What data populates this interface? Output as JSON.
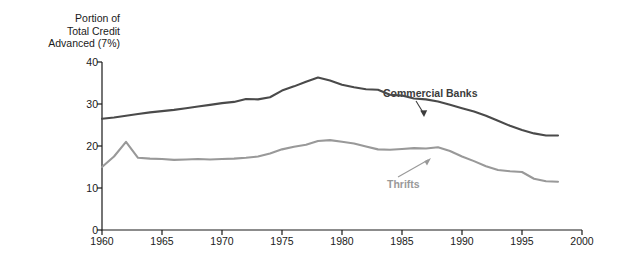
{
  "chart_data": {
    "type": "line",
    "title": "",
    "ylabel": "Portion of\nTotal Credit\nAdvanced (7%)",
    "xlabel": "",
    "xlim": [
      1960,
      2000
    ],
    "ylim": [
      0,
      40
    ],
    "xticks": [
      1960,
      1965,
      1970,
      1975,
      1980,
      1985,
      1990,
      1995,
      2000
    ],
    "yticks": [
      0,
      10,
      20,
      30,
      40
    ],
    "grid": false,
    "legend_position": "inline-annotations",
    "annotations": [
      {
        "text": "Commercial Banks",
        "series": "Commercial Banks",
        "arrow": "down-right"
      },
      {
        "text": "Thrifts",
        "series": "Thrifts",
        "arrow": "up-right"
      }
    ],
    "series": [
      {
        "name": "Commercial Banks",
        "color": "#4a4a4a",
        "x": [
          1960,
          1961,
          1962,
          1963,
          1964,
          1965,
          1966,
          1967,
          1968,
          1969,
          1970,
          1971,
          1972,
          1973,
          1974,
          1975,
          1976,
          1977,
          1978,
          1979,
          1980,
          1981,
          1982,
          1983,
          1984,
          1985,
          1986,
          1987,
          1988,
          1989,
          1990,
          1991,
          1992,
          1993,
          1994,
          1995,
          1996,
          1997,
          1998
        ],
        "values": [
          26.5,
          26.8,
          27.2,
          27.6,
          28.0,
          28.3,
          28.6,
          29.0,
          29.4,
          29.8,
          30.2,
          30.5,
          31.2,
          31.1,
          31.6,
          33.2,
          34.2,
          35.3,
          36.3,
          35.6,
          34.6,
          34.0,
          33.5,
          33.4,
          32.2,
          32.0,
          31.3,
          31.1,
          30.6,
          29.8,
          29.0,
          28.2,
          27.2,
          26.0,
          24.8,
          23.8,
          23.0,
          22.5,
          22.5
        ]
      },
      {
        "name": "Thrifts",
        "color": "#999999",
        "x": [
          1960,
          1961,
          1962,
          1963,
          1964,
          1965,
          1966,
          1967,
          1968,
          1969,
          1970,
          1971,
          1972,
          1973,
          1974,
          1975,
          1976,
          1977,
          1978,
          1979,
          1980,
          1981,
          1982,
          1983,
          1984,
          1985,
          1986,
          1987,
          1988,
          1989,
          1990,
          1991,
          1992,
          1993,
          1994,
          1995,
          1996,
          1997,
          1998
        ],
        "values": [
          15.0,
          17.5,
          21.0,
          17.2,
          17.0,
          16.9,
          16.7,
          16.8,
          16.9,
          16.8,
          16.9,
          17.0,
          17.2,
          17.5,
          18.2,
          19.2,
          19.8,
          20.3,
          21.2,
          21.4,
          21.0,
          20.6,
          19.9,
          19.2,
          19.1,
          19.3,
          19.5,
          19.4,
          19.7,
          18.8,
          17.5,
          16.4,
          15.2,
          14.3,
          14.0,
          13.8,
          12.2,
          11.6,
          11.5
        ]
      }
    ],
    "series_notes": {
      "Commercial Banks": "rises from 26.5 in 1960 to a 1974 peak near 36.4, declines to about 22.5 by 1993-1995, then rises sharply to about 27.5 by 1997-1998",
      "Thrifts": "starts near 15 in 1960, spikes to about 21 in 1962, holds near 17 through the 1960s, peaks near 21.5 in 1978-1979, then declines steadily to about 6.4 by 1998"
    }
  },
  "labels": {
    "y_axis_title": "Portion of\nTotal Credit\nAdvanced (7%)",
    "commercial_banks": "Commercial Banks",
    "thrifts": "Thrifts",
    "y0": "0",
    "y10": "10",
    "y20": "20",
    "y30": "30",
    "y40": "40",
    "x1960": "1960",
    "x1965": "1965",
    "x1970": "1970",
    "x1975": "1975",
    "x1980": "1980",
    "x1985": "1985",
    "x1990": "1990",
    "x1995": "1995",
    "x2000": "2000"
  },
  "colors": {
    "commercial_banks_line": "#4a4a4a",
    "thrifts_line": "#999999",
    "axis": "#1a1a1a",
    "background": "#ffffff"
  }
}
